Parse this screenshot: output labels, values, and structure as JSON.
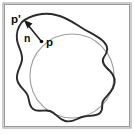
{
  "figure": {
    "type": "geometric-diagram",
    "width": 134,
    "height": 134,
    "background_color": "#ffffff"
  },
  "frame": {
    "name": "border-frame",
    "stroke_color": "#9a9a9a",
    "x": 3,
    "y": 3,
    "width": 128,
    "height": 125
  },
  "shapes": {
    "blob": {
      "label": "irregular closed surface contour",
      "stroke_color": "#2b2b2b",
      "stroke_width": 1.9,
      "path": "M 22 22 C 30 15 44 12 56 15 C 66 17 74 23 82 28 C 90 33 98 36 104 42 C 109 47 107 53 104 57 C 101 61 104 66 110 71 C 115 76 116 82 113 88 C 110 94 105 97 103 101 C 101 105 104 109 100 113 C 96 117 88 115 82 117 C 76 119 72 123 65 121 C 58 119 56 113 50 111 C 44 109 38 113 33 109 C 28 105 30 99 27 94 C 24 89 18 86 17 79 C 16 72 21 67 22 60 C 23 53 18 47 17 40 C 16 33 18 27 22 22 Z"
    },
    "circle": {
      "label": "tangent sphere cross-section",
      "stroke_color": "#9d9d9d",
      "stroke_width": 1.1,
      "center_x": 72,
      "center_y": 76,
      "radius": 42
    }
  },
  "points": {
    "p": {
      "label": "p",
      "description": "point on the sphere surface",
      "dot_x": 41.5,
      "dot_y": 41.5,
      "text_x": 46,
      "text_y": 46
    },
    "p_prime": {
      "label": "p'",
      "description": "projected point on the irregular surface",
      "dot_x": 24,
      "dot_y": 20,
      "text_x": 11,
      "text_y": 19
    }
  },
  "vectors": {
    "normal": {
      "label": "n",
      "description": "surface normal direction from p toward p-prime",
      "tail_x": 41,
      "tail_y": 41,
      "tip_x": 25,
      "tip_y": 21,
      "text_x": 25,
      "text_y": 39,
      "stroke_color": "#1a1a1a"
    }
  },
  "colors": {
    "blob_stroke": "#2b2b2b",
    "circle_stroke": "#9d9d9d",
    "frame_stroke": "#9a9a9a",
    "label_fill": "#0d0d0d",
    "background": "#ffffff"
  }
}
